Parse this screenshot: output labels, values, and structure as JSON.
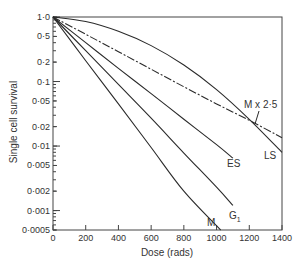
{
  "chart_data": {
    "type": "line",
    "title": "",
    "xlabel": "Dose (rads)",
    "ylabel": "Single cell survival",
    "xlim": [
      0,
      1400
    ],
    "ylim": [
      0.0005,
      1.0
    ],
    "yscale": "log",
    "grid": false,
    "legend": "inline labels",
    "x_ticks": [
      0,
      200,
      400,
      600,
      800,
      1000,
      1200,
      1400
    ],
    "x_tick_labels": [
      "0",
      "200",
      "400",
      "600",
      "800",
      "1000",
      "1200",
      "1400"
    ],
    "y_ticks": [
      1.0,
      0.5,
      0.2,
      0.1,
      0.05,
      0.02,
      0.01,
      0.005,
      0.002,
      0.001,
      0.0005
    ],
    "y_tick_labels": [
      "1·0",
      "0·5",
      "0·2",
      "0·1",
      "0·05",
      "0·02",
      "0·01",
      "0·005",
      "0·002",
      "0·001",
      "0·0005"
    ],
    "series": [
      {
        "name": "M",
        "style": "solid",
        "x": [
          0,
          200,
          400,
          600,
          800,
          1025
        ],
        "y": [
          1.0,
          0.21,
          0.045,
          0.0095,
          0.002,
          0.0005
        ]
      },
      {
        "name": "G1",
        "style": "solid",
        "x": [
          0,
          200,
          400,
          600,
          800,
          1000,
          1100
        ],
        "y": [
          1.0,
          0.3,
          0.09,
          0.027,
          0.0078,
          0.0023,
          0.0012
        ]
      },
      {
        "name": "ES",
        "style": "solid",
        "x": [
          0,
          200,
          400,
          600,
          800,
          1000,
          1100
        ],
        "y": [
          1.0,
          0.4,
          0.16,
          0.065,
          0.026,
          0.0105,
          0.0065
        ]
      },
      {
        "name": "LS",
        "style": "solid",
        "x": [
          0,
          200,
          400,
          600,
          800,
          1000,
          1200,
          1400
        ],
        "y": [
          1.0,
          0.85,
          0.6,
          0.36,
          0.18,
          0.075,
          0.026,
          0.008
        ]
      },
      {
        "name": "M x 2.5",
        "style": "dashed",
        "x": [
          0,
          200,
          400,
          600,
          800,
          1000,
          1200,
          1400
        ],
        "y": [
          1.0,
          0.54,
          0.29,
          0.155,
          0.083,
          0.045,
          0.025,
          0.0135
        ]
      }
    ],
    "annotations": [
      {
        "text": "M",
        "x": 960,
        "y": 0.00055
      },
      {
        "text": "G",
        "subscript": "1",
        "x": 1100,
        "y": 0.0007
      },
      {
        "text": "ES",
        "x": 1105,
        "y": 0.0048
      },
      {
        "text": "LS",
        "x": 1360,
        "y": 0.004
      },
      {
        "text": "M x 2·5",
        "x": 1250,
        "y": 0.06
      }
    ]
  },
  "labels": {
    "xlabel": "Dose (rads)",
    "ylabel": "Single cell survival",
    "series_M": "M",
    "series_G": "G",
    "series_G_sub": "1",
    "series_ES": "ES",
    "series_LS": "LS",
    "series_Mx25": "M x 2·5"
  },
  "colors": {
    "line": "#2a2a2a",
    "axis": "#444444",
    "text": "#333333"
  }
}
